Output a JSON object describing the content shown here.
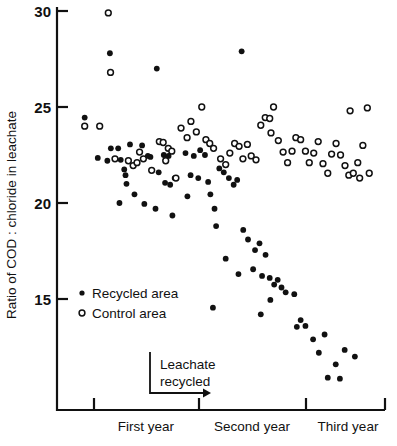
{
  "chart_data": {
    "type": "scatter",
    "title": "",
    "xlabel": "",
    "ylabel": "Ratio of COD : chloride in leachate",
    "ylim": [
      10.6,
      30.0
    ],
    "xlim": [
      0,
      100
    ],
    "grid": false,
    "yticks": [
      15,
      20,
      25,
      30
    ],
    "ytick_labels": [
      "15",
      "20",
      "25",
      "30"
    ],
    "x_category_labels": [
      "First year",
      "Second year",
      "Third year"
    ],
    "x_category_tick_positions": [
      11.4,
      43.4,
      76.1
    ],
    "legend_position": "inside-left",
    "series": [
      {
        "name": "Recycled area",
        "marker": "filled-circle",
        "color": "#111111",
        "points": [
          [
            6.8,
            24.45
          ],
          [
            14.7,
            27.8
          ],
          [
            29.4,
            27.0
          ],
          [
            15.0,
            22.85
          ],
          [
            17.3,
            22.85
          ],
          [
            21.0,
            23.05
          ],
          [
            10.9,
            22.35
          ],
          [
            13.9,
            22.2
          ],
          [
            18.1,
            22.25
          ],
          [
            19.2,
            21.75
          ],
          [
            19.6,
            21.45
          ],
          [
            24.8,
            23.0
          ],
          [
            26.6,
            22.45
          ],
          [
            27.4,
            22.4
          ],
          [
            19.9,
            21.0
          ],
          [
            22.4,
            20.45
          ],
          [
            17.7,
            20.0
          ],
          [
            25.5,
            19.95
          ],
          [
            31.6,
            22.5
          ],
          [
            33.1,
            22.45
          ],
          [
            30.0,
            21.6
          ],
          [
            32.0,
            21.05
          ],
          [
            33.6,
            20.95
          ],
          [
            35.0,
            21.3
          ],
          [
            29.0,
            19.7
          ],
          [
            34.3,
            19.35
          ],
          [
            38.4,
            22.6
          ],
          [
            41.0,
            22.45
          ],
          [
            43.0,
            22.75
          ],
          [
            44.5,
            22.5
          ],
          [
            40.0,
            21.45
          ],
          [
            42.4,
            21.3
          ],
          [
            45.5,
            21.1
          ],
          [
            39.0,
            20.35
          ],
          [
            46.2,
            20.45
          ],
          [
            47.5,
            19.7
          ],
          [
            49.0,
            21.8
          ],
          [
            50.4,
            21.6
          ],
          [
            52.0,
            21.3
          ],
          [
            53.5,
            20.95
          ],
          [
            54.6,
            21.2
          ],
          [
            48.0,
            18.8
          ],
          [
            51.0,
            17.1
          ],
          [
            55.0,
            16.3
          ],
          [
            56.5,
            18.6
          ],
          [
            58.0,
            18.1
          ],
          [
            60.2,
            17.55
          ],
          [
            47.0,
            14.55
          ],
          [
            56.0,
            27.9
          ],
          [
            61.6,
            17.9
          ],
          [
            63.5,
            17.3
          ],
          [
            59.6,
            16.55
          ],
          [
            62.4,
            16.2
          ],
          [
            64.8,
            16.1
          ],
          [
            66.2,
            15.75
          ],
          [
            67.3,
            16.0
          ],
          [
            68.5,
            15.6
          ],
          [
            69.8,
            15.35
          ],
          [
            65.0,
            14.95
          ],
          [
            72.5,
            15.25
          ],
          [
            62.0,
            14.2
          ],
          [
            74.5,
            13.9
          ],
          [
            76.0,
            13.6
          ],
          [
            73.3,
            13.55
          ],
          [
            78.4,
            12.9
          ],
          [
            82.0,
            13.15
          ],
          [
            80.2,
            12.2
          ],
          [
            85.5,
            11.6
          ],
          [
            88.3,
            12.35
          ],
          [
            83.0,
            10.9
          ],
          [
            86.8,
            10.85
          ],
          [
            91.5,
            12.0
          ]
        ]
      },
      {
        "name": "Control area",
        "marker": "open-circle",
        "color": "#111111",
        "points": [
          [
            6.8,
            24.0
          ],
          [
            11.5,
            24.0
          ],
          [
            14.2,
            29.9
          ],
          [
            14.9,
            26.8
          ],
          [
            16.3,
            22.3
          ],
          [
            20.5,
            22.2
          ],
          [
            22.0,
            21.95
          ],
          [
            23.2,
            22.1
          ],
          [
            24.0,
            22.65
          ],
          [
            25.2,
            22.3
          ],
          [
            27.8,
            21.7
          ],
          [
            30.2,
            23.2
          ],
          [
            31.4,
            23.15
          ],
          [
            33.0,
            22.85
          ],
          [
            34.1,
            22.7
          ],
          [
            32.2,
            22.2
          ],
          [
            35.4,
            21.3
          ],
          [
            37.0,
            23.9
          ],
          [
            38.9,
            23.4
          ],
          [
            40.1,
            24.25
          ],
          [
            41.8,
            23.7
          ],
          [
            43.5,
            25.0
          ],
          [
            44.8,
            23.3
          ],
          [
            46.0,
            23.1
          ],
          [
            47.2,
            22.85
          ],
          [
            49.4,
            22.3
          ],
          [
            51.0,
            22.0
          ],
          [
            52.3,
            22.6
          ],
          [
            53.8,
            23.1
          ],
          [
            55.2,
            22.95
          ],
          [
            56.4,
            22.3
          ],
          [
            57.8,
            23.05
          ],
          [
            59.0,
            22.45
          ],
          [
            60.5,
            22.25
          ],
          [
            62.0,
            24.05
          ],
          [
            63.4,
            24.45
          ],
          [
            64.8,
            24.4
          ],
          [
            66.0,
            25.0
          ],
          [
            65.2,
            23.65
          ],
          [
            67.5,
            23.25
          ],
          [
            69.0,
            22.65
          ],
          [
            70.4,
            22.1
          ],
          [
            71.8,
            22.7
          ],
          [
            73.0,
            23.4
          ],
          [
            74.5,
            23.3
          ],
          [
            76.0,
            22.7
          ],
          [
            77.2,
            22.1
          ],
          [
            78.6,
            22.6
          ],
          [
            80.0,
            23.2
          ],
          [
            81.5,
            22.05
          ],
          [
            83.0,
            21.55
          ],
          [
            84.2,
            22.55
          ],
          [
            85.6,
            23.1
          ],
          [
            87.0,
            22.5
          ],
          [
            88.4,
            21.95
          ],
          [
            89.6,
            21.45
          ],
          [
            91.0,
            21.55
          ],
          [
            92.4,
            22.1
          ],
          [
            94.0,
            23.0
          ],
          [
            95.4,
            24.95
          ],
          [
            96.0,
            21.55
          ],
          [
            93.0,
            21.3
          ],
          [
            90.0,
            24.8
          ]
        ]
      }
    ],
    "annotation": {
      "line1": "Leachate",
      "line2": "recycled",
      "arrow_direction": "right"
    }
  }
}
